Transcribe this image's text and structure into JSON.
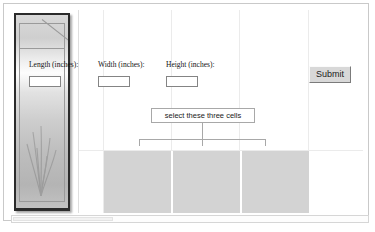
{
  "photo": {
    "alt": "aquarium-tank-photo"
  },
  "form": {
    "fields": [
      {
        "name": "length",
        "label": "Length (inches):",
        "value": "",
        "placeholder": ""
      },
      {
        "name": "width",
        "label": "Width (inches):",
        "value": "",
        "placeholder": ""
      },
      {
        "name": "height",
        "label": "Height (inches):",
        "value": "",
        "placeholder": ""
      }
    ],
    "submit_label": "Submit"
  },
  "annotation": {
    "callout_text": "select these three cells",
    "target_cell_count": 3
  },
  "cells": {
    "items": [
      {
        "name": "cell-length",
        "value": ""
      },
      {
        "name": "cell-width",
        "value": ""
      },
      {
        "name": "cell-height",
        "value": ""
      }
    ],
    "fill_color": "#d3d3d3"
  },
  "colors": {
    "selection_gray": "#d3d3d3",
    "gridline": "#ebebeb",
    "callout_border": "#a8a8a8",
    "button_face": "#d8d8d8"
  }
}
